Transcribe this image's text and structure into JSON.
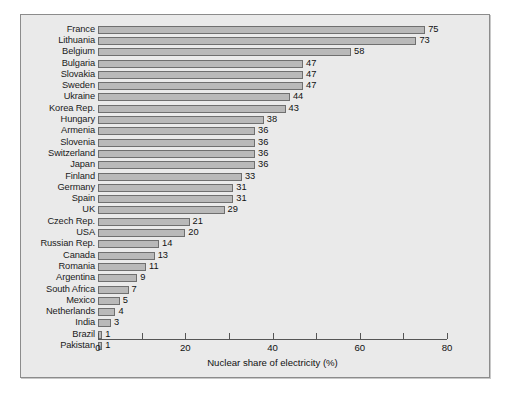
{
  "chart_data": {
    "type": "bar",
    "orientation": "horizontal",
    "title": "",
    "xlabel": "Nuclear share of electricity (%)",
    "ylabel": "",
    "xlim": [
      0,
      80
    ],
    "xticks": [
      0,
      20,
      40,
      60,
      80
    ],
    "xtick_labels": [
      "0",
      "20",
      "40",
      "60",
      "80"
    ],
    "minor_xticks": [
      10,
      30,
      50,
      70
    ],
    "grid": false,
    "legend": null,
    "value_labels_shown": true,
    "categories": [
      "France",
      "Lithuania",
      "Belgium",
      "Bulgaria",
      "Slovakia",
      "Sweden",
      "Ukraine",
      "Korea Rep.",
      "Hungary",
      "Armenia",
      "Slovenia",
      "Switzerland",
      "Japan",
      "Finland",
      "Germany",
      "Spain",
      "UK",
      "Czech Rep.",
      "USA",
      "Russian Rep.",
      "Canada",
      "Romania",
      "Argentina",
      "South Africa",
      "Mexico",
      "Netherlands",
      "India",
      "Brazil",
      "Pakistan"
    ],
    "values": [
      75,
      73,
      58,
      47,
      47,
      47,
      44,
      43,
      38,
      36,
      36,
      36,
      36,
      33,
      31,
      31,
      29,
      21,
      20,
      14,
      13,
      11,
      9,
      7,
      5,
      4,
      3,
      1,
      1
    ],
    "colors": {
      "bar_fill": "#b9b9b9",
      "bar_edge": "#6f6f6f",
      "panel_background": "#eaeaea",
      "frame_border": "#8c8c8c",
      "text": "#111111",
      "axis": "#555555",
      "page_background": "#ffffff"
    }
  }
}
